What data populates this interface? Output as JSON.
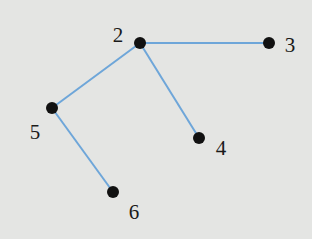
{
  "diagram": {
    "type": "tree-graph",
    "colors": {
      "background": "#e4e5e3",
      "edge": "#6ea6d9",
      "node": "#111111",
      "label": "#1a1a1a"
    },
    "nodes": [
      {
        "id": "2",
        "label": "2",
        "x": 140,
        "y": 43,
        "label_x": 118,
        "label_y": 35
      },
      {
        "id": "3",
        "label": "3",
        "x": 269,
        "y": 43,
        "label_x": 290,
        "label_y": 45
      },
      {
        "id": "5",
        "label": "5",
        "x": 52,
        "y": 108,
        "label_x": 35,
        "label_y": 132
      },
      {
        "id": "4",
        "label": "4",
        "x": 199,
        "y": 138,
        "label_x": 221,
        "label_y": 148
      },
      {
        "id": "6",
        "label": "6",
        "x": 113,
        "y": 192,
        "label_x": 134,
        "label_y": 212
      }
    ],
    "edges": [
      {
        "from": "2",
        "to": "3"
      },
      {
        "from": "2",
        "to": "5"
      },
      {
        "from": "2",
        "to": "4"
      },
      {
        "from": "5",
        "to": "6"
      }
    ]
  }
}
